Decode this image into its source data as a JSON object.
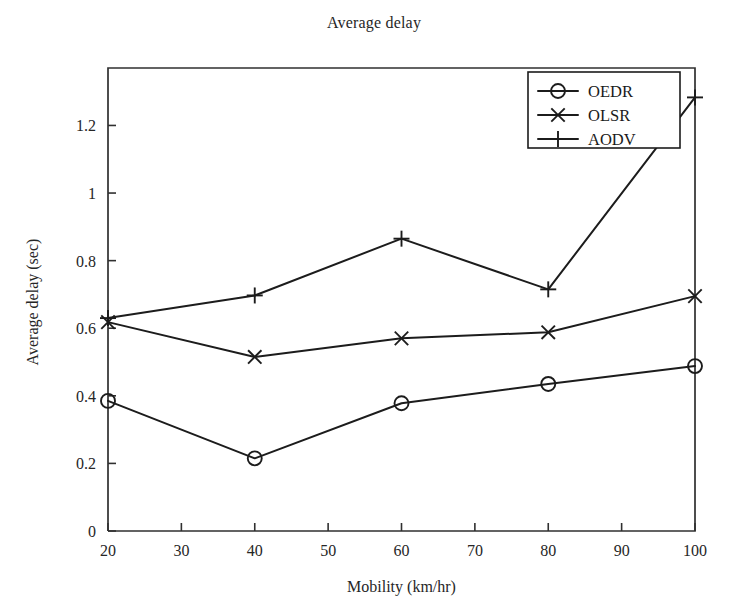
{
  "chart_data": {
    "type": "line",
    "title": "Average delay",
    "xlabel": "Mobility (km/hr)",
    "ylabel": "Average delay (sec)",
    "x": [
      20,
      40,
      60,
      80,
      100
    ],
    "xlim": [
      20,
      100
    ],
    "ylim": [
      0,
      1.37
    ],
    "xticks": [
      "20",
      "30",
      "40",
      "50",
      "60",
      "70",
      "80",
      "90",
      "100"
    ],
    "xtick_values": [
      20,
      30,
      40,
      50,
      60,
      70,
      80,
      90,
      100
    ],
    "yticks": [
      "0",
      "0.2",
      "0.4",
      "0.6",
      "0.8",
      "1",
      "1.2"
    ],
    "ytick_values": [
      0,
      0.2,
      0.4,
      0.6,
      0.8,
      1.0,
      1.2
    ],
    "grid": false,
    "legend_position": "upper-right",
    "line_color": "#1c1c1c",
    "series": [
      {
        "name": "OEDR",
        "marker": "circle",
        "values": [
          0.385,
          0.215,
          0.378,
          0.435,
          0.488
        ]
      },
      {
        "name": "OLSR",
        "marker": "cross-x",
        "values": [
          0.618,
          0.515,
          0.57,
          0.588,
          0.695
        ]
      },
      {
        "name": "AODV",
        "marker": "plus",
        "values": [
          0.63,
          0.697,
          0.865,
          0.715,
          1.283
        ]
      }
    ]
  },
  "legend": {
    "items": [
      {
        "label": "OEDR",
        "marker": "circle"
      },
      {
        "label": "OLSR",
        "marker": "cross-x"
      },
      {
        "label": "AODV",
        "marker": "plus"
      }
    ]
  }
}
